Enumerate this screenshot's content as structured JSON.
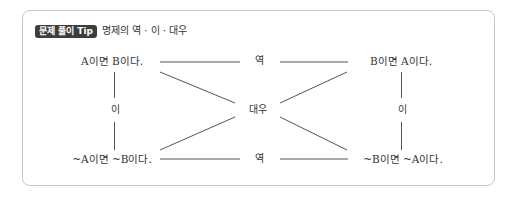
{
  "header": {
    "badge": "문제 풀이 Tip",
    "title": "명제의 역 · 이 · 대우"
  },
  "diagram": {
    "nodes": {
      "original": "A이면 B이다.",
      "converse": "B이면 A이다.",
      "inverse": "~A이면 ~B이다.",
      "contrapositive": "~B이면 ~A이다."
    },
    "relations": {
      "top": "역",
      "bottom": "역",
      "left": "이",
      "right": "이",
      "center": "대우"
    }
  },
  "colors": {
    "badge_bg": "#3d3d3d",
    "border": "#c8c8c8",
    "line": "#555555"
  }
}
